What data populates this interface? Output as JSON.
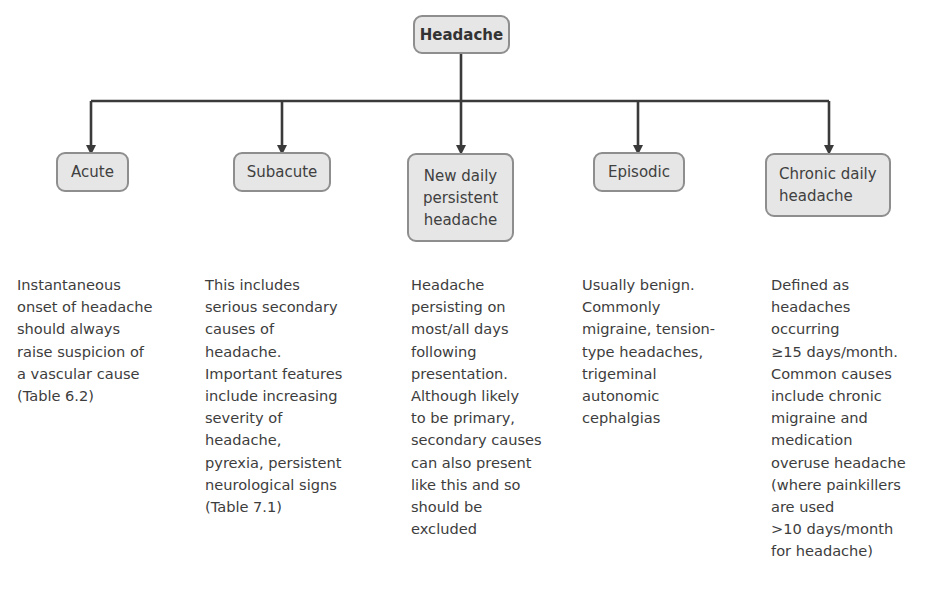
{
  "root": {
    "label": "Headache"
  },
  "categories": [
    {
      "label": "Acute",
      "description": "Instantaneous\nonset of headache\nshould always\nraise suspicion of\na vascular cause\n(Table 6.2)"
    },
    {
      "label": "Subacute",
      "description": "This includes\nserious secondary\ncauses of\nheadache.\nImportant features\ninclude increasing\nseverity of\nheadache,\npyrexia, persistent\nneurological signs\n(Table 7.1)"
    },
    {
      "label": "New daily\npersistent\nheadache",
      "description": "Headache\npersisting on\nmost/all days\nfollowing\npresentation.\nAlthough likely\nto be primary,\nsecondary causes\ncan also present\nlike this and so\nshould be\nexcluded"
    },
    {
      "label": "Episodic",
      "description": "Usually benign.\nCommonly\nmigraine, tension-\ntype headaches,\ntrigeminal\nautonomic\ncephalgias"
    },
    {
      "label": "Chronic daily\nheadache",
      "description": "Defined as\nheadaches\noccurring\n≥15 days/month.\nCommon causes\ninclude chronic\nmigraine and\nmedication\noveruse headache\n(where painkillers\nare used\n>10 days/month\nfor headache)"
    }
  ],
  "colors": {
    "box_fill": "#e6e6e6",
    "box_border": "#8e8e8e",
    "connector": "#3a3a3a"
  }
}
